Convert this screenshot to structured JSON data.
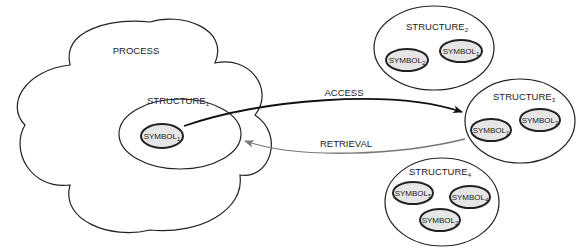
{
  "process": {
    "label": "PROCESS"
  },
  "structures": [
    {
      "id": "s1",
      "label": "STRUCTURE",
      "sub": "1",
      "symbols": [
        {
          "label": "SYMBOL",
          "sub": "1"
        }
      ]
    },
    {
      "id": "s2",
      "label": "STRUCTURE",
      "sub": "2",
      "symbols": [
        {
          "label": "SYMBOL",
          "sub": "2"
        },
        {
          "label": "SYMBOL",
          "sub": "1"
        }
      ]
    },
    {
      "id": "s3",
      "label": "STRUCTURE",
      "sub": "3",
      "symbols": [
        {
          "label": "SYMBOL",
          "sub": "1"
        },
        {
          "label": "SYMBOL",
          "sub": "3"
        }
      ]
    },
    {
      "id": "s4",
      "label": "STRUCTURE",
      "sub": "4",
      "symbols": [
        {
          "label": "SYMBOL",
          "sub": "5"
        },
        {
          "label": "SYMBOL",
          "sub": "4"
        },
        {
          "label": "SYMBOL",
          "sub": "2"
        }
      ]
    }
  ],
  "arrows": {
    "access": {
      "label": "ACCESS",
      "color": "#111111"
    },
    "retrieval": {
      "label": "RETRIEVAL",
      "color": "#777777"
    }
  },
  "colors": {
    "symbol_fill": "#e6e6e6",
    "stroke": "#222222"
  }
}
